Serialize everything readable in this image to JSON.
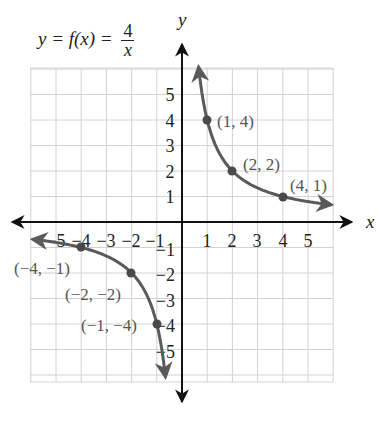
{
  "title": {
    "lhs": "y = f(x) = ",
    "numerator": "4",
    "denominator": "x"
  },
  "axes": {
    "x_label": "x",
    "y_label": "y",
    "x_ticks_positive": [
      "1",
      "2",
      "3",
      "4",
      "5"
    ],
    "x_ticks_negative": [
      "−5",
      "−4",
      "−3",
      "−2",
      "−1"
    ],
    "y_ticks_positive": [
      "1",
      "2",
      "3",
      "4",
      "5"
    ],
    "y_ticks_negative": [
      "−1",
      "−2",
      "−3",
      "−4",
      "−5"
    ]
  },
  "points": [
    {
      "label": "(1, 4)"
    },
    {
      "label": "(2, 2)"
    },
    {
      "label": "(4, 1)"
    },
    {
      "label": "(−4, −1)"
    },
    {
      "label": "(−2, −2)"
    },
    {
      "label": "(−1, −4)"
    }
  ],
  "colors": {
    "curve": "#5a5a5a",
    "axis": "#111111",
    "grid": "#cfcfcf",
    "label": "#555555"
  },
  "chart_data": {
    "type": "line",
    "xlabel": "x",
    "ylabel": "y",
    "xlim": [
      -6,
      6
    ],
    "ylim": [
      -6,
      6
    ],
    "grid": true,
    "legend": null,
    "x_ticks": [
      -5,
      -4,
      -3,
      -2,
      -1,
      1,
      2,
      3,
      4,
      5
    ],
    "y_ticks": [
      -5,
      -4,
      -3,
      -2,
      -1,
      1,
      2,
      3,
      4,
      5
    ],
    "series": [
      {
        "name": "f(x) = 4/x (x > 0 branch)",
        "x": [
          0.7,
          1,
          2,
          4,
          6
        ],
        "y": [
          5.71,
          4,
          2,
          1,
          0.67
        ]
      },
      {
        "name": "f(x) = 4/x (x < 0 branch)",
        "x": [
          -6,
          -4,
          -2,
          -1,
          -0.7
        ],
        "y": [
          -0.67,
          -1,
          -2,
          -4,
          -5.71
        ]
      }
    ],
    "annotations": [
      {
        "x": 1,
        "y": 4,
        "text": "(1, 4)"
      },
      {
        "x": 2,
        "y": 2,
        "text": "(2, 2)"
      },
      {
        "x": 4,
        "y": 1,
        "text": "(4, 1)"
      },
      {
        "x": -4,
        "y": -1,
        "text": "(−4, −1)"
      },
      {
        "x": -2,
        "y": -2,
        "text": "(−2, −2)"
      },
      {
        "x": -1,
        "y": -4,
        "text": "(−1, −4)"
      }
    ]
  }
}
